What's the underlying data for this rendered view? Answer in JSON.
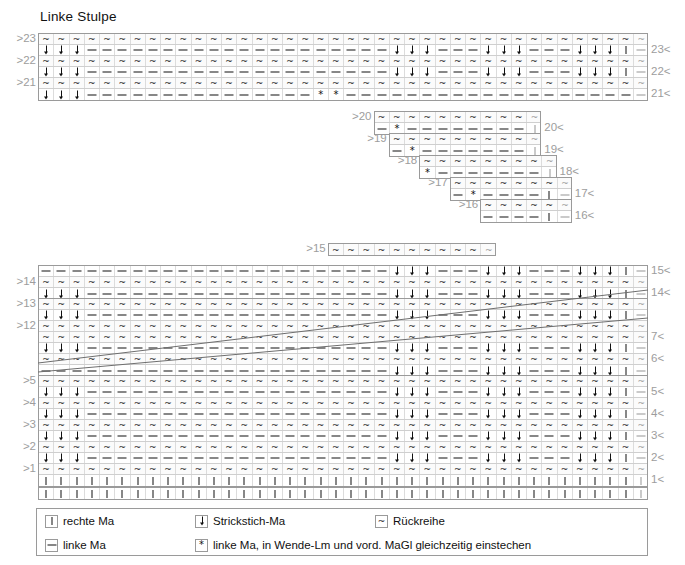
{
  "title": "Linke Stulpe",
  "symbols": {
    "knit": "|",
    "purl": "–",
    "stitch_down": "↓",
    "return_row": "~",
    "star": "*"
  },
  "legend": {
    "items": [
      {
        "symbol": "knit",
        "glyph": "|",
        "label": "rechte Ma"
      },
      {
        "symbol": "stitch_down",
        "glyph": "↓",
        "label": "Strickstich-Ma"
      },
      {
        "symbol": "return_row",
        "glyph": "~",
        "label": "Rückreihe"
      },
      {
        "symbol": "purl",
        "glyph": "–",
        "label": "linke Ma"
      },
      {
        "symbol": "star",
        "glyph": "*",
        "label": "linke Ma, in Wende-Lm und vord. MaGl gleichzeitig einstechen"
      }
    ]
  },
  "chart_data": {
    "type": "table",
    "title": "Linke Stulpe",
    "total_columns": 40,
    "colors": {
      "grid": "#dcdcdc",
      "border": "#9a9a9a",
      "label": "#9d9d9d",
      "ink": "#111111"
    },
    "left_labels": [
      ">23",
      ">22",
      ">21",
      ">20",
      ">19",
      ">18",
      ">17",
      ">16",
      ">15",
      ">14",
      ">13",
      ">12",
      ">5",
      ">4",
      ">3",
      ">2",
      ">1"
    ],
    "right_labels": [
      "23<",
      "22<",
      "21<",
      "20<",
      "19<",
      "18<",
      "17<",
      "16<",
      "15<",
      "14<",
      "7<",
      "6<",
      "5<",
      "4<",
      "3<",
      "2<",
      "1<"
    ],
    "blocks": [
      {
        "name": "top-block",
        "columns": 40,
        "rows": [
          {
            "id": "r23-return",
            "kind": "return",
            "left_label": ">23",
            "cells": "~~~~~~~~~~~~~~~~~~~~~~~~~~~~~~~~~~~~~~~~"
          },
          {
            "id": "r23-work",
            "kind": "work",
            "right_label": "23<",
            "cells": "↓↓↓--------------------↓↓↓---↓↓↓---↓↓↓|"
          },
          {
            "id": "r22-return",
            "kind": "return",
            "left_label": ">22",
            "cells": "~~~~~~~~~~~~~~~~~~~~~~~~~~~~~~~~~~~~~~~~"
          },
          {
            "id": "r22-work",
            "kind": "work",
            "right_label": "22<",
            "cells": "↓↓↓--------------------↓↓↓---↓↓↓---↓↓↓|"
          },
          {
            "id": "r21-return",
            "kind": "return",
            "left_label": ">21",
            "cells": "~~~~~~~~~~~~~~~~~~~~~~~~~~~~~~~~~~~~~~~~"
          },
          {
            "id": "r21-work",
            "kind": "work",
            "right_label": "21<",
            "cells": "↓↓↓---------------**--------------------|"
          }
        ]
      },
      {
        "name": "step-20",
        "columns": 11,
        "offset_cols": 22,
        "rows": [
          {
            "id": "r20-return",
            "kind": "return",
            "left_label": ">20",
            "cells": "~~~~~~~~~~~"
          },
          {
            "id": "r20-work",
            "kind": "work",
            "right_label": "20<",
            "cells": "-*--------|"
          }
        ]
      },
      {
        "name": "step-19",
        "columns": 10,
        "offset_cols": 23,
        "rows": [
          {
            "id": "r19-return",
            "kind": "return",
            "left_label": ">19",
            "cells": "~~~~~~~~~~"
          },
          {
            "id": "r19-work",
            "kind": "work",
            "right_label": "19<",
            "cells": "-*-------|"
          }
        ]
      },
      {
        "name": "step-18",
        "columns": 9,
        "offset_cols": 24,
        "rows": [
          {
            "id": "r18-return",
            "kind": "return",
            "left_label": ">18",
            "cells": "~~~~~~~~~"
          },
          {
            "id": "r18-work",
            "kind": "work",
            "right_label": "18<",
            "cells": "*-------|"
          }
        ]
      },
      {
        "name": "step-17",
        "columns": 8,
        "offset_cols": 26,
        "rows": [
          {
            "id": "r17-return",
            "kind": "return",
            "left_label": ">17",
            "cells": "~~~~~~~~"
          },
          {
            "id": "r17-work",
            "kind": "work",
            "right_label": "17<",
            "cells": "-*----|"
          }
        ]
      },
      {
        "name": "step-16",
        "columns": 6,
        "offset_cols": 28,
        "rows": [
          {
            "id": "r16-return",
            "kind": "return",
            "left_label": ">16",
            "cells": "~~~~~~"
          },
          {
            "id": "r16-work",
            "kind": "work",
            "right_label": "16<",
            "cells": "----|"
          }
        ]
      },
      {
        "name": "step-15",
        "columns": 11,
        "offset_cols": 22,
        "rows": [
          {
            "id": "r15-return",
            "kind": "return",
            "left_label": ">15",
            "cells": "~~~~~~~~~~~"
          }
        ]
      },
      {
        "name": "mid-block",
        "columns": 40,
        "rows": [
          {
            "id": "r15-work",
            "kind": "work",
            "right_label": "15<",
            "cells": "-----------------------↓↓↓---↓↓↓---↓↓↓|"
          },
          {
            "id": "r14-return",
            "kind": "return",
            "left_label": ">14",
            "cells": "~~~~~~~~~~~~~~~~~~~~~~~~~~~~~~~~~~~~~~~~"
          },
          {
            "id": "r14-work",
            "kind": "work",
            "right_label": "14<",
            "cells": "↓↓↓--------------------↓↓↓---↓↓↓---↓↓↓|"
          }
        ]
      },
      {
        "name": "wedge-block",
        "columns": 40,
        "rows": [
          {
            "id": "r13-return",
            "kind": "return",
            "left_label": ">13",
            "cells": "~~~~~~~~~~~~~~~~~~~~~~~~~~~~~~~~~~~~~~~~"
          },
          {
            "id": "r13-work",
            "kind": "work",
            "cells": "↓↓↓--------------------↓↓↓---↓↓↓---↓↓↓|"
          },
          {
            "id": "r12-return",
            "kind": "return",
            "left_label": ">12",
            "cells": "~~~~~~~~~~~~~~~~~~~~~~~~~~~~~~~~~~~~~~~~"
          },
          {
            "id": "r7-return",
            "kind": "return",
            "right_label": "7<",
            "cells": "~~~~~~~~~~~~~~~~~~~~~~~~~~~~~~~~~~~~~~~~"
          },
          {
            "id": "r7-work",
            "kind": "work",
            "cells": "↓↓↓--------------------↓↓↓---↓↓↓---↓↓↓|"
          },
          {
            "id": "r6-return",
            "kind": "return",
            "right_label": "6<",
            "cells": "~~~~~~~~~~~~~~~~~~~~~~~~~~~~~~~~~~~~~~~~"
          },
          {
            "id": "r6-work",
            "kind": "work",
            "cells": "-----------------------↓↓↓---↓↓↓---↓↓↓|"
          }
        ]
      },
      {
        "name": "bottom-block",
        "columns": 40,
        "rows": [
          {
            "id": "r5-return",
            "kind": "return",
            "left_label": ">5",
            "cells": "~~~~~~~~~~~~~~~~~~~~~~~~~~~~~~~~~~~~~~~~"
          },
          {
            "id": "r5-work",
            "kind": "work",
            "right_label": "5<",
            "cells": "↓↓↓--------------------↓↓↓---↓↓↓---↓↓↓|"
          },
          {
            "id": "r4-return",
            "kind": "return",
            "left_label": ">4",
            "cells": "~~~~~~~~~~~~~~~~~~~~~~~~~~~~~~~~~~~~~~~~"
          },
          {
            "id": "r4-work",
            "kind": "work",
            "right_label": "4<",
            "cells": "↓↓↓--------------------↓↓↓---↓↓↓---↓↓↓|"
          },
          {
            "id": "r3-return",
            "kind": "return",
            "left_label": ">3",
            "cells": "~~~~~~~~~~~~~~~~~~~~~~~~~~~~~~~~~~~~~~~~"
          },
          {
            "id": "r3-work",
            "kind": "work",
            "right_label": "3<",
            "cells": "↓↓↓--------------------↓↓↓---↓↓↓---↓↓↓|"
          },
          {
            "id": "r2-return",
            "kind": "return",
            "left_label": ">2",
            "cells": "~~~~~~~~~~~~~~~~~~~~~~~~~~~~~~~~~~~~~~~~"
          },
          {
            "id": "r2-work",
            "kind": "work",
            "right_label": "2<",
            "cells": "↓↓↓--------------------↓↓↓---↓↓↓---↓↓↓|"
          },
          {
            "id": "r1-return",
            "kind": "return",
            "left_label": ">1",
            "cells": "~~~~~~~~~~~~~~~~~~~~~~~~~~~~~~~~~~~~~~~~"
          },
          {
            "id": "r1-work",
            "kind": "work",
            "right_label": "1<",
            "cells": "||||||||||||||||||||||||||||||||||||||||"
          }
        ]
      },
      {
        "name": "caston-block",
        "columns": 40,
        "rows": [
          {
            "id": "r0-caston",
            "kind": "work",
            "cells": "||||||||||||||||||||||||||||||||||||||||"
          }
        ]
      }
    ]
  }
}
